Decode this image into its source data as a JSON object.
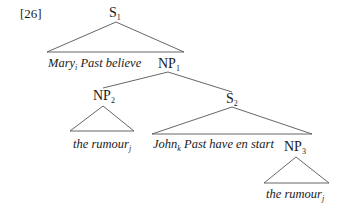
{
  "example_number": "[26]",
  "colors": {
    "line": "#555555",
    "text": "#1a1a1a",
    "background": "#ffffff"
  },
  "nodes": {
    "s1": {
      "label": "S",
      "sub": "1"
    },
    "np1": {
      "label": "NP",
      "sub": "1"
    },
    "np2": {
      "label": "NP",
      "sub": "2"
    },
    "s2": {
      "label": "S",
      "sub": "2"
    },
    "np3": {
      "label": "NP",
      "sub": "3"
    }
  },
  "leaves": {
    "s1_text": {
      "pre": "Mary",
      "sub": "i",
      "post": " Past believe"
    },
    "np2_text": {
      "pre": "the rumour",
      "sub": "j",
      "post": ""
    },
    "s2_text": {
      "pre": "John",
      "sub": "k",
      "post": " Past have en start"
    },
    "np3_text": {
      "pre": "the rumour",
      "sub": "j",
      "post": ""
    }
  }
}
